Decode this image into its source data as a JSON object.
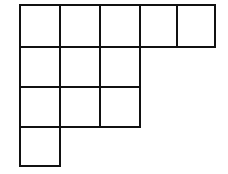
{
  "diagram": {
    "type": "young-diagram",
    "row_lengths": [
      5,
      3,
      3,
      1
    ],
    "col_x": [
      20,
      60,
      100,
      140,
      177,
      215
    ],
    "row_y": [
      5,
      47,
      87,
      127,
      166
    ],
    "line_color": "#111111",
    "fill_color": "#ffffff"
  }
}
